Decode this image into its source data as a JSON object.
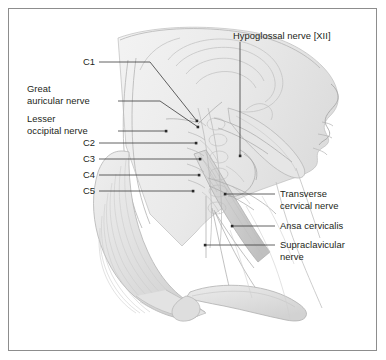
{
  "figure": {
    "view": "Right lateral view of head and neck",
    "frame_color": "#8d8d8d",
    "background_color": "#ffffff",
    "text_color": "#231f20",
    "leader_color": "#3a3a3a"
  },
  "labels": {
    "hypoglossal_nerve": "Hypoglossal nerve [XII]",
    "c1": "C1",
    "great_auricular_nerve": "Great\nauricular nerve",
    "lesser_occipital_nerve": "Lesser\noccipital nerve",
    "c2": "C2",
    "c3": "C3",
    "c4": "C4",
    "c5": "C5",
    "transverse_cervical_nerve": "Transverse\ncervical nerve",
    "ansa_cervicalis": "Ansa cervicalis",
    "supraclavicular_nerve": "Supraclavicular\nnerve"
  },
  "anatomy_parts": [
    "head-and-face-outline",
    "mandible",
    "skull-base",
    "cervical-vertebrae",
    "sternocleidomastoid-muscle",
    "trapezius-muscle",
    "clavicle",
    "cervical-plexus-nerve-roots",
    "nerve-branches"
  ]
}
